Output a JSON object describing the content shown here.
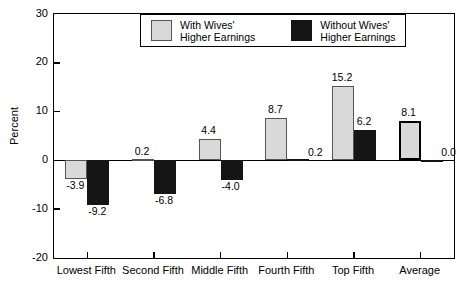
{
  "chart_data": {
    "type": "bar",
    "title": "",
    "xlabel": "",
    "ylabel": "Percent",
    "ylim": [
      -20,
      30
    ],
    "yticks": [
      30,
      20,
      10,
      0,
      -10,
      -20
    ],
    "ytick_labels": [
      "30",
      "20",
      "10",
      "0",
      "-10",
      "-20"
    ],
    "grid": false,
    "legend_position": "top-center",
    "categories": [
      "Lowest Fifth",
      "Second Fifth",
      "Middle Fifth",
      "Fourth Fifth",
      "Top Fifth",
      "Average"
    ],
    "series": [
      {
        "name": "With Wives' Higher Earnings",
        "color": "#d9d9d9",
        "values": [
          -3.9,
          0.2,
          4.4,
          8.7,
          15.2,
          8.1
        ],
        "labels": [
          "-3.9",
          "0.2",
          "4.4",
          "8.7",
          "15.2",
          "8.1"
        ]
      },
      {
        "name": "Without Wives' Higher Earnings",
        "color": "#151515",
        "values": [
          -9.2,
          -6.8,
          -4.0,
          0.2,
          6.2,
          0.0
        ],
        "labels": [
          "-9.2",
          "-6.8",
          "-4.0",
          "0.2",
          "6.2",
          "0.0"
        ]
      }
    ],
    "emphasized_bars": [
      {
        "series": 0,
        "category": 5
      }
    ]
  },
  "legend": {
    "entries": [
      {
        "line1": "With Wives'",
        "line2": "Higher Earnings",
        "swatch": "light-swatch"
      },
      {
        "line1": "Without Wives'",
        "line2": "Higher Earnings",
        "swatch": "dark-swatch"
      }
    ]
  }
}
